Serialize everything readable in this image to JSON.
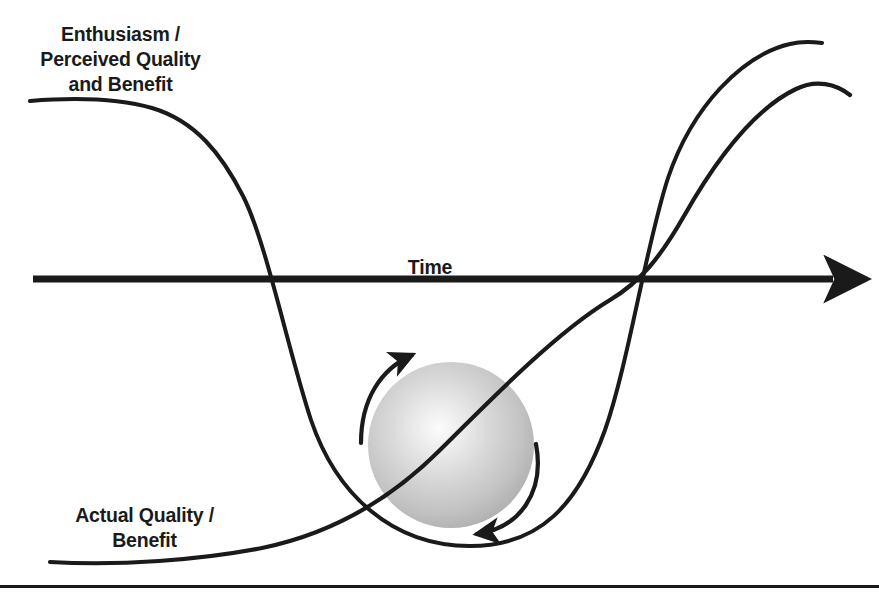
{
  "diagram": {
    "kind": "hype-cycle-diagram",
    "background_color": "#ffffff",
    "ink_color": "#1a1a1a"
  },
  "labels": {
    "vertical_axis": "Enthusiasm /\nPerceived Quality\nand Benefit",
    "horizontal_axis": "Time",
    "actual_curve": "Actual Quality /\nBenefit"
  },
  "axis": {
    "name": "time-axis",
    "orientation": "horizontal",
    "color": "#1a1a1a",
    "thickness": 7,
    "x_start": 33,
    "x_end": 845,
    "y": 279,
    "arrowhead": "right"
  },
  "sphere": {
    "name": "rolling-sphere",
    "center_x": 451,
    "center_y": 445,
    "radius": 83,
    "highlight_x": 440,
    "highlight_y": 431,
    "highlight_color": "#fbfbfb",
    "mid_color": "#c9c9c9",
    "edge_color": "#a4a4a4"
  },
  "rotation_arrows": {
    "top_arc_direction": "clockwise-right",
    "bottom_arc_direction": "clockwise-left",
    "color": "#1a1a1a"
  },
  "chart_data": {
    "type": "line",
    "title": "",
    "xlabel": "Time",
    "ylabel": "Enthusiasm / Perceived Quality and Benefit",
    "grid": false,
    "legend": "none",
    "axis_zero_y": 279,
    "series": [
      {
        "name": "Enthusiasm / Perceived Quality and Benefit",
        "description": "Hype curve: starts very high and flat, plunges through zero into a deep trough, then climbs steeply to a high plateau.",
        "path": "M 30 101 C 80 97 120 99 152 108 C 196 121 222 155 243 196 C 266 241 288 350 311 420 C 336 494 392 546 470 546 C 540 546 578 505 605 430 C 628 365 646 245 668 178 C 692 107 742 55 790 44 C 802 41 814 42 822 43",
        "points": [
          {
            "x": 30,
            "y": 101
          },
          {
            "x": 152,
            "y": 108
          },
          {
            "x": 243,
            "y": 196
          },
          {
            "x": 280,
            "y": 279
          },
          {
            "x": 311,
            "y": 420
          },
          {
            "x": 470,
            "y": 546
          },
          {
            "x": 605,
            "y": 430
          },
          {
            "x": 633,
            "y": 279
          },
          {
            "x": 668,
            "y": 178
          },
          {
            "x": 790,
            "y": 44
          },
          {
            "x": 822,
            "y": 43
          }
        ]
      },
      {
        "name": "Actual Quality / Benefit",
        "description": "Actual quality curve: starts low and nearly flat, rises slowly then steadily, crossing zero at the same point as the hype curve, then levels into a high plateau slightly below the hype plateau.",
        "path": "M 50 562 C 120 566 200 560 262 548 C 330 534 390 500 440 450 C 500 390 560 330 610 300 C 640 282 660 258 684 216 C 714 163 752 110 796 89 C 816 79 836 84 850 95",
        "points": [
          {
            "x": 50,
            "y": 562
          },
          {
            "x": 262,
            "y": 548
          },
          {
            "x": 370,
            "y": 520
          },
          {
            "x": 440,
            "y": 450
          },
          {
            "x": 610,
            "y": 300
          },
          {
            "x": 633,
            "y": 279
          },
          {
            "x": 684,
            "y": 216
          },
          {
            "x": 796,
            "y": 89
          },
          {
            "x": 850,
            "y": 95
          }
        ]
      }
    ],
    "annotations": [
      {
        "text": "Enthusiasm /\nPerceived Quality\nand Benefit",
        "x": 120,
        "y": 55
      },
      {
        "text": "Time",
        "x": 430,
        "y": 266
      },
      {
        "text": "Actual Quality /\nBenefit",
        "x": 145,
        "y": 528
      }
    ]
  },
  "footer_rule": {
    "name": "bottom-divider",
    "y": 586,
    "x_start": 0,
    "x_end": 879,
    "color": "#1a1a1a"
  }
}
